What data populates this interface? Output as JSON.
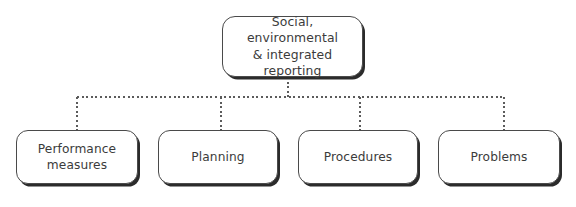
{
  "diagram": {
    "type": "hierarchy-tree",
    "orientation": "top-down",
    "connector_style": "dotted",
    "colors": {
      "background": "#ffffff",
      "box_fill": "#ffffff",
      "box_border": "#4a4a4a",
      "box_shadow": "#2b2b2b",
      "text": "#3b3b3b",
      "connector": "#5b5b5b"
    },
    "root": {
      "id": "root",
      "label": "Social, environmental & integrated reporting",
      "label_line_1": "Social, environmental",
      "label_line_2": "& integrated reporting"
    },
    "children": [
      {
        "id": "performance-measures",
        "label": "Performance measures",
        "label_line_1": "Performance",
        "label_line_2": "measures"
      },
      {
        "id": "planning",
        "label": "Planning",
        "label_line_1": "Planning",
        "label_line_2": ""
      },
      {
        "id": "procedures",
        "label": "Procedures",
        "label_line_1": "Procedures",
        "label_line_2": ""
      },
      {
        "id": "problems",
        "label": "Problems",
        "label_line_1": "Problems",
        "label_line_2": ""
      }
    ]
  }
}
